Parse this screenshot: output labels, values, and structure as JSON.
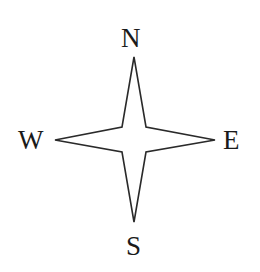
{
  "compass": {
    "labels": {
      "north": "N",
      "south": "S",
      "east": "E",
      "west": "W"
    },
    "colors": {
      "stroke": "#2a2a2a",
      "fill": "#ffffff",
      "text": "#1a1a1a"
    }
  }
}
